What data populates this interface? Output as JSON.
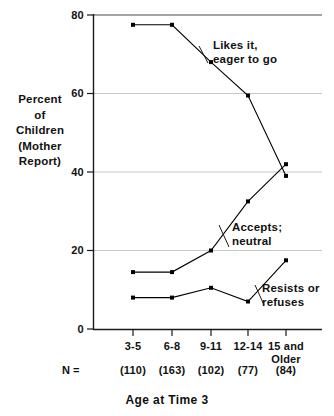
{
  "chart_data": {
    "type": "line",
    "title": "Age at Time 3",
    "xlabel": "Age at Time 3",
    "ylabel": "Percent of Children (Mother Report)",
    "ylabel_lines": [
      "Percent",
      "of",
      "Children",
      "(Mother",
      "Report)"
    ],
    "categories": [
      "3-5",
      "6-8",
      "9-11",
      "12-14",
      "15 and Older"
    ],
    "category_labels": [
      {
        "line1": "3-5",
        "line2": ""
      },
      {
        "line1": "6-8",
        "line2": ""
      },
      {
        "line1": "9-11",
        "line2": ""
      },
      {
        "line1": "12-14",
        "line2": ""
      },
      {
        "line1": "15 and",
        "line2": "Older"
      }
    ],
    "n_prefix": "N =",
    "n_values": [
      "(110)",
      "(163)",
      "(102)",
      "(77)",
      "(84)"
    ],
    "ylim": [
      0,
      80
    ],
    "yticks": [
      0,
      20,
      40,
      60,
      80
    ],
    "ytick_labels": [
      "0",
      "20",
      "40",
      "60",
      "80"
    ],
    "grid": true,
    "grid_color": "#c8c8c8",
    "legend": "annotations-inline",
    "line_color": "#000000",
    "marker": "square",
    "series": [
      {
        "name": "Likes it, eager to go",
        "label_lines": [
          "Likes it,",
          "eager to go"
        ],
        "values": [
          77.5,
          77.5,
          68,
          59.5,
          39
        ]
      },
      {
        "name": "Accepts; neutral",
        "label_lines": [
          "Accepts;",
          "neutral"
        ],
        "values": [
          14.5,
          14.5,
          20,
          32.5,
          42
        ]
      },
      {
        "name": "Resists or refuses",
        "label_lines": [
          "Resists or",
          "refuses"
        ],
        "values": [
          8,
          8,
          10.5,
          7,
          17.5
        ]
      }
    ]
  }
}
